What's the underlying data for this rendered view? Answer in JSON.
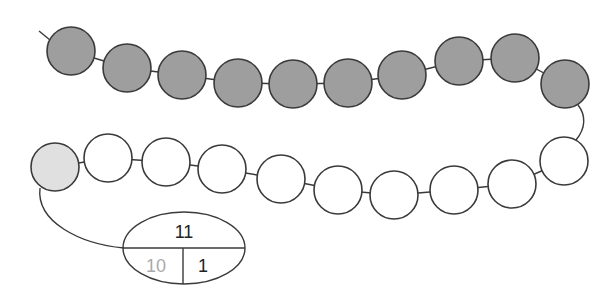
{
  "diagram": {
    "type": "bead-string",
    "colors": {
      "dark_bead": "#9e9e9e",
      "light_bead": "#e0e0e0",
      "white_bead": "#ffffff",
      "stroke": "#3a3a3a",
      "faded_text": "#aaaaaa",
      "text": "#222222"
    },
    "bead_radius": 24,
    "dark_beads": [
      {
        "cx": 71,
        "cy": 51
      },
      {
        "cx": 127,
        "cy": 68
      },
      {
        "cx": 182,
        "cy": 75
      },
      {
        "cx": 238,
        "cy": 83
      },
      {
        "cx": 293,
        "cy": 84
      },
      {
        "cx": 348,
        "cy": 83
      },
      {
        "cx": 402,
        "cy": 75
      },
      {
        "cx": 459,
        "cy": 61
      },
      {
        "cx": 515,
        "cy": 58
      },
      {
        "cx": 565,
        "cy": 84
      }
    ],
    "white_beads": [
      {
        "cx": 564,
        "cy": 161
      },
      {
        "cx": 512,
        "cy": 184
      },
      {
        "cx": 454,
        "cy": 190
      },
      {
        "cx": 394,
        "cy": 195
      },
      {
        "cx": 338,
        "cy": 190
      },
      {
        "cx": 281,
        "cy": 179
      },
      {
        "cx": 222,
        "cy": 169
      },
      {
        "cx": 166,
        "cy": 162
      },
      {
        "cx": 108,
        "cy": 158
      }
    ],
    "highlight_bead": {
      "cx": 55,
      "cy": 167
    },
    "number_bond": {
      "whole": "11",
      "part_left": "10",
      "part_right": "1"
    },
    "counts": {
      "dark": 10,
      "white": 9,
      "highlighted": 1
    }
  }
}
